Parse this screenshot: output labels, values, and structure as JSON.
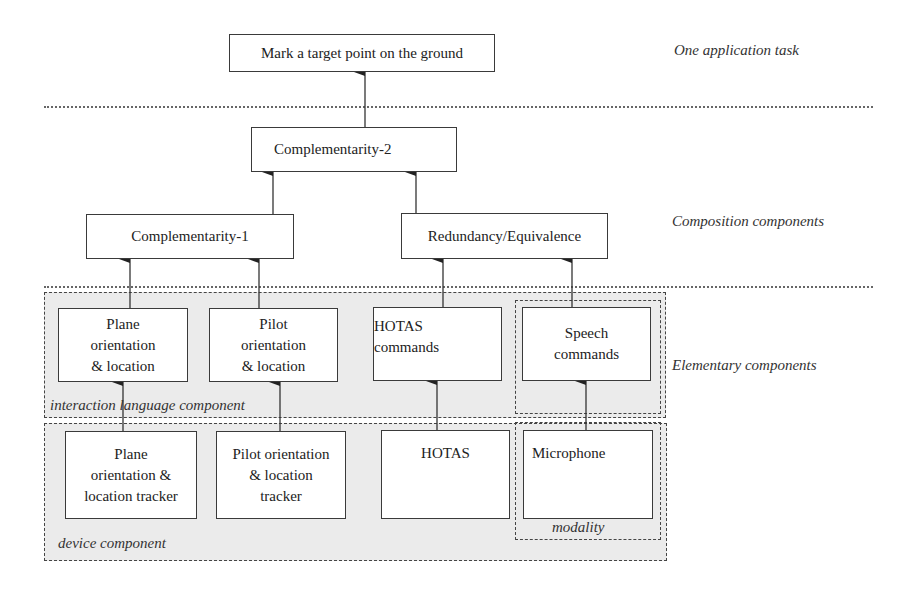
{
  "layers": {
    "task": "One application task",
    "composition": "Composition components",
    "elementary": "Elementary components"
  },
  "task_box": {
    "label": "Mark a target point on the ground"
  },
  "composition": {
    "complementarity2": "Complementarity-2",
    "complementarity1": "Complementarity-1",
    "redundancy": "Redundancy/Equivalence"
  },
  "interaction_language": {
    "region_label": "interaction language component",
    "items": [
      {
        "lines": [
          "Plane",
          "orientation",
          "& location"
        ]
      },
      {
        "lines": [
          "Pilot",
          "orientation",
          "& location"
        ]
      },
      {
        "lines": [
          "HOTAS",
          "commands"
        ]
      },
      {
        "lines": [
          "Speech",
          "commands"
        ]
      }
    ]
  },
  "device": {
    "region_label": "device component",
    "items": [
      {
        "lines": [
          "Plane",
          "orientation &",
          "location tracker"
        ]
      },
      {
        "lines": [
          "Pilot orientation",
          "& location",
          "tracker"
        ]
      },
      {
        "lines": [
          "HOTAS"
        ]
      },
      {
        "lines": [
          "Microphone"
        ]
      }
    ]
  },
  "modality": {
    "label": "modality"
  },
  "colors": {
    "region_fill": "#ebebeb",
    "stroke": "#3a3a3a",
    "background": "#ffffff"
  }
}
